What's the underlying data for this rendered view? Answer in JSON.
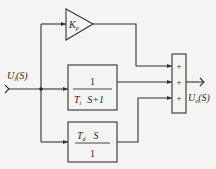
{
  "diagram": {
    "type": "block-diagram",
    "input_label": {
      "main": "U",
      "sub": "i",
      "arg": "(S)"
    },
    "output_label": {
      "main": "U",
      "sub": "o",
      "arg": "(S)"
    },
    "blocks": {
      "proportional": {
        "symbol": "K",
        "sub": "p",
        "shape": "triangle"
      },
      "integral": {
        "numerator": "1",
        "denominator_main": "T",
        "denominator_sub": "i",
        "denominator_rest": "S+1"
      },
      "derivative": {
        "numerator_main": "T",
        "numerator_sub": "d",
        "numerator_rest": "S",
        "denominator": "1"
      }
    },
    "summer": {
      "signs": [
        "+",
        "+",
        "+"
      ]
    },
    "colors": {
      "line": "#333333",
      "background": "#f4f4f2"
    }
  }
}
